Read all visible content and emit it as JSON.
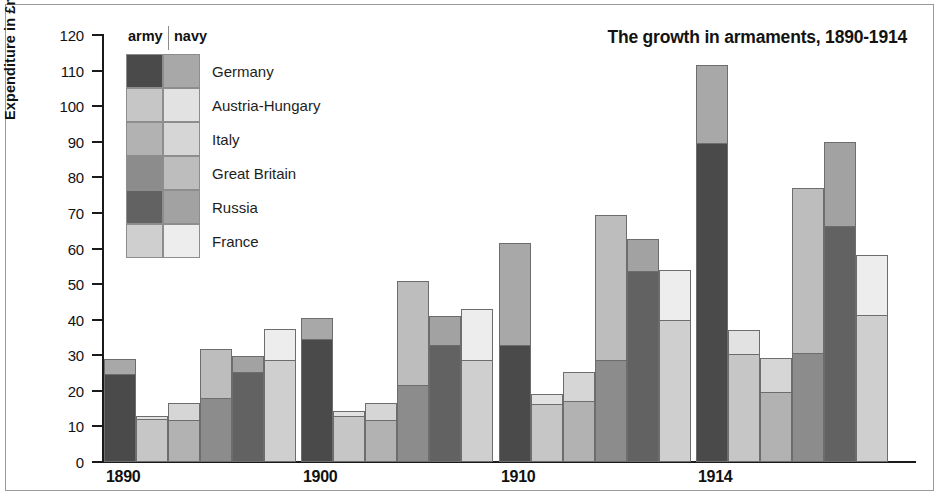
{
  "chart_data": {
    "type": "bar",
    "subtype": "grouped-stacked",
    "title": "The growth in armaments, 1890-1914",
    "xlabel": "",
    "ylabel": "Expenditure in £millions",
    "ylim": [
      0,
      120
    ],
    "ytick_step": 10,
    "yticks": [
      0,
      10,
      20,
      30,
      40,
      50,
      60,
      70,
      80,
      90,
      100,
      110,
      120
    ],
    "grid": false,
    "legend_position": "top-left-inside",
    "categories": [
      "1890",
      "1900",
      "1910",
      "1914"
    ],
    "stack_order": [
      "army",
      "navy"
    ],
    "stack_labels": {
      "army": "army",
      "navy": "navy"
    },
    "series": [
      {
        "name": "Germany",
        "army": [
          24.5,
          34.3,
          32.5,
          89.5
        ],
        "navy": [
          4.5,
          6.2,
          29.0,
          22.0
        ],
        "totals": [
          29.0,
          40.5,
          61.5,
          111.5
        ]
      },
      {
        "name": "Austria-Hungary",
        "army": [
          11.8,
          12.7,
          16.0,
          30.0
        ],
        "navy": [
          1.0,
          1.5,
          3.2,
          7.0
        ],
        "totals": [
          12.8,
          14.2,
          19.2,
          37.0
        ]
      },
      {
        "name": "Italy",
        "army": [
          11.5,
          11.5,
          17.0,
          19.3
        ],
        "navy": [
          5.0,
          5.0,
          8.2,
          10.0
        ],
        "totals": [
          16.5,
          16.5,
          25.2,
          29.3
        ]
      },
      {
        "name": "Great Britain",
        "army": [
          17.8,
          21.5,
          28.3,
          30.3
        ],
        "navy": [
          14.0,
          29.5,
          41.0,
          46.7
        ],
        "totals": [
          31.8,
          51.0,
          69.3,
          77.0
        ]
      },
      {
        "name": "Russia",
        "army": [
          25.0,
          32.5,
          53.5,
          66.0
        ],
        "navy": [
          4.8,
          8.5,
          9.2,
          24.0
        ],
        "totals": [
          29.8,
          41.0,
          62.7,
          90.0
        ]
      },
      {
        "name": "France",
        "army": [
          28.5,
          28.5,
          39.5,
          41.0
        ],
        "navy": [
          9.0,
          14.5,
          14.5,
          17.2
        ],
        "totals": [
          37.5,
          43.0,
          54.0,
          58.2
        ]
      }
    ],
    "colors": {
      "Germany": {
        "army": "#4a4a4a",
        "navy": "#a8a8a8"
      },
      "Austria-Hungary": {
        "army": "#c6c6c6",
        "navy": "#e2e2e2"
      },
      "Italy": {
        "army": "#b2b2b2",
        "navy": "#d6d6d6"
      },
      "Great Britain": {
        "army": "#8c8c8c",
        "navy": "#bdbdbd"
      },
      "Russia": {
        "army": "#626262",
        "navy": "#a2a2a2"
      },
      "France": {
        "army": "#cfcfcf",
        "navy": "#ededed"
      }
    }
  }
}
